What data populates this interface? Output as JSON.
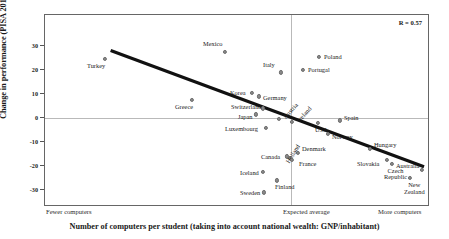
{
  "chart_data": {
    "type": "scatter",
    "title": "",
    "xlabel": "Number of computers per student (taking into account national wealth: GNP/inhabitant)",
    "ylabel": "Change in performance (PISA 2012–PISA 2003)",
    "annotation": "R = 0.57",
    "ylim": [
      -37,
      37
    ],
    "yticks": [
      30,
      20,
      10,
      0,
      -10,
      -20,
      -30
    ],
    "ytick_labels": [
      "30",
      "20",
      "10",
      "0",
      "-10",
      "-20",
      "-30"
    ],
    "xtick_labels": [
      "Fewer computers",
      "Expected average",
      "More computers"
    ],
    "grid": false,
    "legend": "none",
    "reference_lines": {
      "horizontal_zero": 0,
      "vertical_expected_average": 0
    },
    "trend_line": {
      "x_start_px": 110,
      "y_start_value": 28,
      "x_end_px": 425,
      "y_end_value": -21
    },
    "points": [
      {
        "label": "Turkey",
        "x_px": 104,
        "y_value": 24.5,
        "label_dx": -18,
        "label_dy": 4,
        "rot": 0
      },
      {
        "label": "Mexico",
        "x_px": 224,
        "y_value": 27.5,
        "label_dx": -22,
        "label_dy": -11,
        "rot": 0
      },
      {
        "label": "Poland",
        "x_px": 318,
        "y_value": 25.5,
        "label_dx": 5,
        "label_dy": -3,
        "rot": 0
      },
      {
        "label": "Italy",
        "x_px": 280,
        "y_value": 19,
        "label_dx": -18,
        "label_dy": -10,
        "rot": 0
      },
      {
        "label": "Portugal",
        "x_px": 302,
        "y_value": 20,
        "label_dx": 5,
        "label_dy": -3,
        "rot": 0
      },
      {
        "label": "Korea",
        "x_px": 251,
        "y_value": 10.5,
        "label_dx": -22,
        "label_dy": -3,
        "rot": 0
      },
      {
        "label": "Germany",
        "x_px": 258,
        "y_value": 9,
        "label_dx": 4,
        "label_dy": -1,
        "rot": 0
      },
      {
        "label": "Greece",
        "x_px": 191,
        "y_value": 7.5,
        "label_dx": -17,
        "label_dy": 4,
        "rot": 0
      },
      {
        "label": "Switzerland",
        "x_px": 262,
        "y_value": 4,
        "label_dx": -32,
        "label_dy": -4,
        "rot": 0
      },
      {
        "label": "Japan",
        "x_px": 255,
        "y_value": 1.5,
        "label_dx": -18,
        "label_dy": 0,
        "rot": 0
      },
      {
        "label": "Austria",
        "x_px": 278,
        "y_value": -0.5,
        "label_dx": 3,
        "label_dy": -3,
        "rot": -48
      },
      {
        "label": "Ireland",
        "x_px": 291,
        "y_value": -1.5,
        "label_dx": 4,
        "label_dy": -3,
        "rot": -48
      },
      {
        "label": "Spain",
        "x_px": 339,
        "y_value": -1,
        "label_dx": 4,
        "label_dy": -5,
        "rot": 0
      },
      {
        "label": "USA",
        "x_px": 317,
        "y_value": -2,
        "label_dx": -3,
        "label_dy": 4,
        "rot": 0
      },
      {
        "label": "Norway",
        "x_px": 327,
        "y_value": -6.5,
        "label_dx": 4,
        "label_dy": 0,
        "rot": 0
      },
      {
        "label": "Luxembourg",
        "x_px": 265,
        "y_value": -4,
        "label_dx": -41,
        "label_dy": -2,
        "rot": 0
      },
      {
        "label": "Hungary",
        "x_px": 369,
        "y_value": -13,
        "label_dx": 4,
        "label_dy": -7,
        "rot": 0
      },
      {
        "label": "Denmark",
        "x_px": 297,
        "y_value": -14.5,
        "label_dx": 4,
        "label_dy": -7,
        "rot": 0
      },
      {
        "label": "Canada",
        "x_px": 286,
        "y_value": -16,
        "label_dx": -26,
        "label_dy": -2,
        "rot": 0
      },
      {
        "label": "Holland",
        "x_px": 289,
        "y_value": -16.5,
        "label_dx": -5,
        "label_dy": 3,
        "rot": -58
      },
      {
        "label": "France",
        "x_px": 291,
        "y_value": -17.5,
        "label_dx": 7,
        "label_dy": 1,
        "rot": 0
      },
      {
        "label": "Slovakia",
        "x_px": 386,
        "y_value": -17.5,
        "label_dx": -30,
        "label_dy": 1,
        "rot": 0
      },
      {
        "label": "Czech Republic",
        "x_px": 391,
        "y_value": -19,
        "label_dx": -8,
        "label_dy": 4,
        "rot": 0
      },
      {
        "label": "Australia",
        "x_px": 421,
        "y_value": -21.5,
        "label_dx": -26,
        "label_dy": -7,
        "rot": 0
      },
      {
        "label": "Iceland",
        "x_px": 262,
        "y_value": -22.5,
        "label_dx": -23,
        "label_dy": -2,
        "rot": 0
      },
      {
        "label": "New Zealand",
        "x_px": 409,
        "y_value": -25,
        "label_dx": -6,
        "label_dy": 4,
        "rot": 0
      },
      {
        "label": "Finland",
        "x_px": 276,
        "y_value": -26,
        "label_dx": -2,
        "label_dy": 4,
        "rot": 0
      },
      {
        "label": "Sweden",
        "x_px": 263,
        "y_value": -31,
        "label_dx": -24,
        "label_dy": -2,
        "rot": 0
      }
    ]
  },
  "colors": {
    "point": "#8a8a8a",
    "trend": "#111111",
    "frame": "#666666",
    "reference": "#b9b9b9"
  }
}
